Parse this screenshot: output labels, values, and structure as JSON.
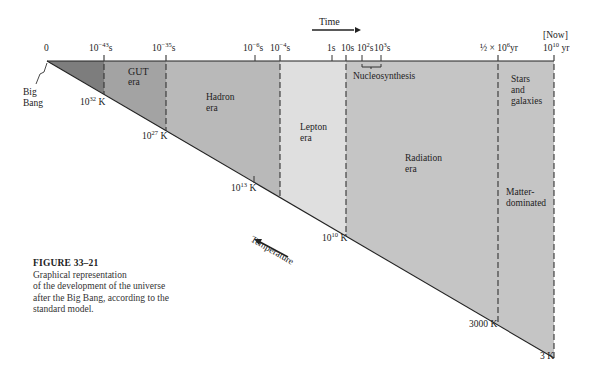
{
  "diagram": {
    "time_axis": {
      "title": "Time",
      "ticks": [
        {
          "label_base": "0",
          "label_exp": "",
          "label_unit": "",
          "x": 47,
          "style": "origin"
        },
        {
          "label_base": "10",
          "label_exp": "−43",
          "label_unit": "s",
          "x": 104,
          "style": "dashed"
        },
        {
          "label_base": "10",
          "label_exp": "−35",
          "label_unit": "s",
          "x": 166,
          "style": "dashed"
        },
        {
          "label_base": "10",
          "label_exp": "−6",
          "label_unit": "s",
          "x": 255,
          "style": "tick"
        },
        {
          "label_base": "10",
          "label_exp": "−4",
          "label_unit": "s",
          "x": 280,
          "style": "dashed"
        },
        {
          "label_base": "1s",
          "label_exp": "",
          "label_unit": "",
          "x": 332,
          "style": "tick"
        },
        {
          "label_base": "10s",
          "label_exp": "",
          "label_unit": "",
          "x": 346,
          "style": "dashed"
        },
        {
          "label_base": "10",
          "label_exp": "2",
          "label_unit": "s",
          "x": 362,
          "style": "tick"
        },
        {
          "label_base": "10",
          "label_exp": "3",
          "label_unit": "s",
          "x": 381,
          "style": "tick"
        },
        {
          "label_base": "½ × 10",
          "label_exp": "6",
          "label_unit": "yr",
          "x": 498,
          "style": "dashed"
        },
        {
          "label_base": "10",
          "label_exp": "10",
          "label_unit": " yr",
          "x": 554,
          "style": "dashed"
        }
      ],
      "now_label": "[Now]"
    },
    "temperature_axis": {
      "title": "Temperature",
      "labels": [
        {
          "base": "10",
          "exp": "32",
          "unit": " K"
        },
        {
          "base": "10",
          "exp": "27",
          "unit": " K"
        },
        {
          "base": "10",
          "exp": "13",
          "unit": " K"
        },
        {
          "base": "10",
          "exp": "10",
          "unit": " K"
        },
        {
          "base": "3000 K",
          "exp": "",
          "unit": ""
        },
        {
          "base": "3 K",
          "exp": "",
          "unit": ""
        }
      ]
    },
    "origin_label": [
      "Big",
      "Bang"
    ],
    "eras": [
      {
        "name": "Planck",
        "lines": [],
        "color": "#7d7d7d"
      },
      {
        "name": "GUT",
        "lines": [
          "GUT",
          "era"
        ],
        "color": "#a2a2a2"
      },
      {
        "name": "Hadron",
        "lines": [
          "Hadron",
          "era"
        ],
        "color": "#b9b9b9"
      },
      {
        "name": "Lepton",
        "lines": [
          "Lepton",
          "era"
        ],
        "color": "#dedede"
      },
      {
        "name": "Radiation",
        "lines": [
          "Radiation",
          "era"
        ],
        "color": "#c4c4c4"
      },
      {
        "name": "Matter",
        "lines": [
          "Stars",
          "and",
          "galaxies"
        ],
        "lines2": [
          "Matter-",
          "dominated"
        ],
        "color": "#c4c4c4"
      }
    ],
    "nucleosynthesis_label": "Nucleosynthesis"
  },
  "caption": {
    "figure_number": "FIGURE 33–21",
    "lines": [
      "Graphical representation",
      "of the development of the universe",
      "after the Big Bang, according to the",
      "standard model."
    ]
  }
}
